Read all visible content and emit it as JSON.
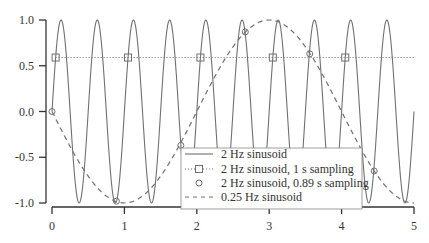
{
  "chart_data": {
    "type": "line",
    "title": "",
    "xlabel": "",
    "ylabel": "",
    "xlim": [
      0,
      5
    ],
    "ylim": [
      -1.0,
      1.0
    ],
    "x_ticks": [
      "0",
      "1",
      "2",
      "3",
      "4",
      "5"
    ],
    "y_ticks": [
      "1.0",
      "0.5",
      "0.0",
      "-0.5",
      "-1.0"
    ],
    "grid": false,
    "legend_position": "lower center-right",
    "series": [
      {
        "name": "2 Hz sinusoid",
        "style": "solid",
        "function": "sin(2*pi*2*t)",
        "t_range": [
          0,
          5
        ]
      },
      {
        "name": "2 Hz sinusoid, 1 s sampling",
        "style": "dotted with square markers",
        "x": [
          0.05,
          1.05,
          2.05,
          3.05,
          4.05
        ],
        "y": [
          0.59,
          0.59,
          0.59,
          0.59,
          0.59
        ]
      },
      {
        "name": "2 Hz sinusoid, 0.89 s sampling",
        "style": "circle markers",
        "x": [
          0,
          0.89,
          1.78,
          2.67,
          3.56,
          4.45
        ],
        "y": [
          0.0,
          -0.98,
          -0.37,
          0.87,
          0.63,
          -0.65
        ]
      },
      {
        "name": "0.25 Hz sinusoid",
        "style": "dashed",
        "function": "-sin(2*pi*0.25*t)",
        "t_range": [
          0,
          5
        ]
      }
    ],
    "legend": [
      "2 Hz sinusoid",
      "2 Hz sinusoid, 1 s sampling",
      "2 Hz sinusoid, 0.89 s sampling",
      "0.25 Hz sinusoid"
    ],
    "colors": {
      "line": "#707070",
      "axis": "#333333"
    }
  }
}
